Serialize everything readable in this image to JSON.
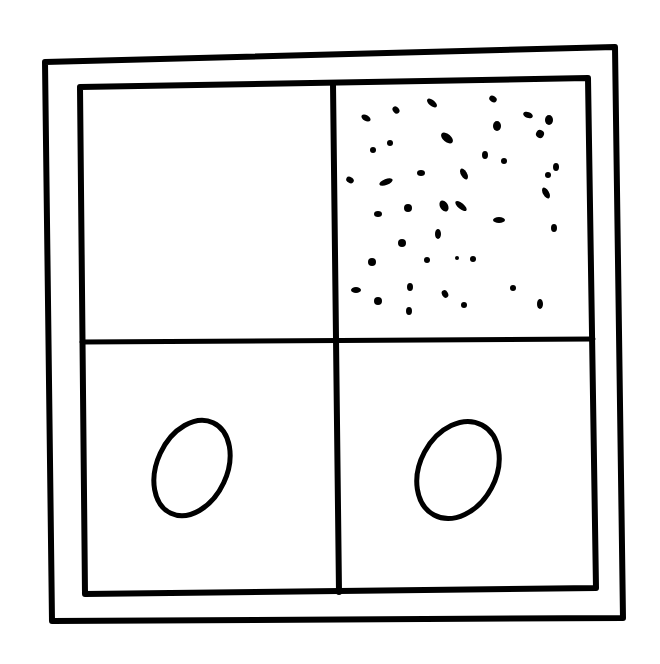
{
  "diagram": {
    "stroke_color": "#000000",
    "background_color": "#ffffff",
    "outer_frame": {
      "points": [
        [
          45,
          62
        ],
        [
          615,
          47
        ],
        [
          623,
          618
        ],
        [
          52,
          621
        ]
      ],
      "stroke_width": 6
    },
    "inner_frame": {
      "points": [
        [
          80,
          87
        ],
        [
          588,
          78
        ],
        [
          596,
          588
        ],
        [
          85,
          594
        ]
      ],
      "stroke_width": 6
    },
    "vertical_divider": {
      "from": [
        333,
        84
      ],
      "to": [
        339,
        592
      ],
      "stroke_width": 6
    },
    "horizontal_divider": {
      "from": [
        82,
        342
      ],
      "to": [
        593,
        339
      ],
      "stroke_width": 5
    },
    "cells": [
      {
        "position": "top-left",
        "content": "empty"
      },
      {
        "position": "top-right",
        "content": "speckles"
      },
      {
        "position": "bottom-left",
        "content": "oval"
      },
      {
        "position": "bottom-right",
        "content": "oval"
      }
    ],
    "ovals": [
      {
        "cell": "bottom-left",
        "cx": 192,
        "cy": 468,
        "rx": 35,
        "ry": 50,
        "rotate": 25
      },
      {
        "cell": "bottom-right",
        "cx": 458,
        "cy": 470,
        "rx": 38,
        "ry": 51,
        "rotate": 28
      }
    ],
    "speckles": [
      [
        366,
        118,
        5,
        3,
        30
      ],
      [
        396,
        110,
        4,
        3,
        50
      ],
      [
        432,
        103,
        6,
        3,
        40
      ],
      [
        493,
        99,
        4,
        3,
        35
      ],
      [
        528,
        115,
        5,
        3,
        20
      ],
      [
        549,
        120,
        4,
        5,
        0
      ],
      [
        373,
        150,
        3,
        3,
        0
      ],
      [
        390,
        143,
        3,
        3,
        0
      ],
      [
        447,
        138,
        7,
        4,
        40
      ],
      [
        497,
        126,
        4,
        5,
        0
      ],
      [
        540,
        134,
        4,
        4,
        30
      ],
      [
        557,
        167,
        2,
        1,
        0
      ],
      [
        485,
        155,
        3,
        4,
        0
      ],
      [
        504,
        161,
        3,
        3,
        0
      ],
      [
        556,
        167,
        3,
        4,
        0
      ],
      [
        548,
        175,
        3,
        3,
        0
      ],
      [
        350,
        180,
        4,
        3,
        30
      ],
      [
        386,
        182,
        7,
        3,
        -20
      ],
      [
        421,
        173,
        4,
        3,
        0
      ],
      [
        464,
        174,
        3,
        6,
        -30
      ],
      [
        546,
        193,
        3,
        6,
        -30
      ],
      [
        378,
        214,
        4,
        3,
        0
      ],
      [
        408,
        208,
        4,
        4,
        0
      ],
      [
        444,
        206,
        4,
        6,
        -30
      ],
      [
        461,
        206,
        7,
        3,
        40
      ],
      [
        499,
        220,
        6,
        3,
        0
      ],
      [
        554,
        228,
        3,
        4,
        0
      ],
      [
        402,
        243,
        4,
        4,
        0
      ],
      [
        438,
        234,
        3,
        5,
        0
      ],
      [
        372,
        262,
        4,
        4,
        0
      ],
      [
        427,
        260,
        3,
        3,
        0
      ],
      [
        473,
        259,
        3,
        3,
        0
      ],
      [
        457,
        258,
        2,
        2,
        0
      ],
      [
        356,
        290,
        5,
        3,
        0
      ],
      [
        378,
        301,
        4,
        4,
        0
      ],
      [
        410,
        287,
        3,
        4,
        0
      ],
      [
        445,
        294,
        3,
        4,
        -30
      ],
      [
        464,
        305,
        3,
        3,
        0
      ],
      [
        409,
        311,
        3,
        4,
        0
      ],
      [
        513,
        288,
        3,
        3,
        0
      ],
      [
        540,
        304,
        3,
        5,
        0
      ]
    ]
  }
}
